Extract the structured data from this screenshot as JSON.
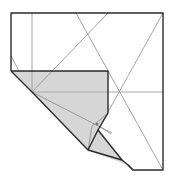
{
  "diagram": {
    "type": "origami-fold-diagram",
    "colors": {
      "paper": "#ffffff",
      "shaded_flap": "#d6d6d6",
      "fold_edge": "#2b2b2b",
      "crease": "#8a8a8a",
      "reference_line": "#a9a9a9"
    },
    "elements": [
      "square-paper-outline",
      "shaded-folded-flap",
      "crease-lines",
      "reference-lines",
      "small-pivot-marker"
    ]
  }
}
